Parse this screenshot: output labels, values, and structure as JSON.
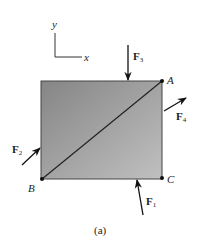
{
  "figure": {
    "caption": "(a)",
    "axes": {
      "x_label": "x",
      "y_label": "y"
    },
    "body": {
      "shape": "rectangle",
      "gradient_start": "#858585",
      "gradient_end": "#c0c0c0",
      "diagonal": "A-B"
    },
    "points": [
      {
        "id": "A",
        "label": "A"
      },
      {
        "id": "B",
        "label": "B"
      },
      {
        "id": "C",
        "label": "C"
      }
    ],
    "forces": [
      {
        "id": "F1",
        "main": "F",
        "sub": "1"
      },
      {
        "id": "F2",
        "main": "F",
        "sub": "2"
      },
      {
        "id": "F3",
        "main": "F",
        "sub": "3"
      },
      {
        "id": "F4",
        "main": "F",
        "sub": "4"
      }
    ]
  }
}
